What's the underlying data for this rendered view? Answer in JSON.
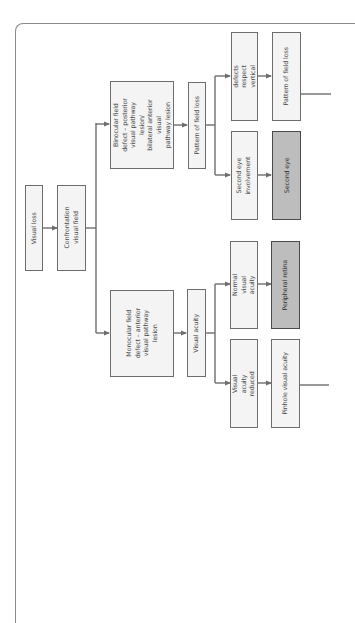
{
  "diagram": {
    "orientation": "rotated-90-ccw",
    "colors": {
      "box_fill": "#f4f4f4",
      "box_fill_highlight": "#bdbdbd",
      "line": "#6d6d6d",
      "frame": "#8a8a8a"
    },
    "nodes": {
      "visual_loss": "Visual loss",
      "confrontation": "Confrontation\nvisual field",
      "binocular": "Binocular field\ndefect – posterior\nvisual pathway lesion/\nbilateral anterior visual\npathway lesion",
      "monocular": "Monocular field\ndefect – anterior\nvisual pathway lesion",
      "pattern_field_loss_1": "Pattern of field loss",
      "visual_acuity": "Visual acuity",
      "field_defects_midline": "Field defects respect\nvertical midline",
      "second_eye_involvement": "Second eye\ninvolvement",
      "normal_visual_acuity": "Normal visual\nacuity",
      "visual_acuity_reduced": "Visual acuity\nreduced",
      "pattern_field_loss_2": "Pattern of field loss",
      "second_eye": "Second eye",
      "peripheral_retina": "Peripheral retina",
      "pinhole_visual_acuity": "Pinhole visual acuity"
    },
    "edges": [
      [
        "Visual loss",
        "Confrontation visual field"
      ],
      [
        "Confrontation visual field",
        "Binocular field defect"
      ],
      [
        "Confrontation visual field",
        "Monocular field defect"
      ],
      [
        "Binocular field defect",
        "Pattern of field loss"
      ],
      [
        "Monocular field defect",
        "Visual acuity"
      ],
      [
        "Pattern of field loss",
        "Field defects respect vertical midline"
      ],
      [
        "Pattern of field loss",
        "Second eye involvement"
      ],
      [
        "Visual acuity",
        "Normal visual acuity"
      ],
      [
        "Visual acuity",
        "Visual acuity reduced"
      ],
      [
        "Field defects respect vertical midline",
        "Pattern of field loss"
      ],
      [
        "Second eye involvement",
        "Second eye"
      ],
      [
        "Normal visual acuity",
        "Peripheral retina"
      ],
      [
        "Visual acuity reduced",
        "Pinhole visual acuity"
      ]
    ],
    "highlighted_nodes": [
      "Second eye",
      "Peripheral retina"
    ]
  }
}
